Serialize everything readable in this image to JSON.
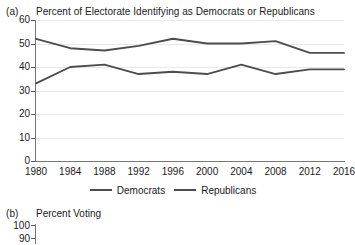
{
  "figure": {
    "panel_a_label": "(a)",
    "panel_b_label": "(b)"
  },
  "chart_data": [
    {
      "type": "line",
      "panel": "(a)",
      "title": "Percent of Electorate Identifying as Democrats or Republicans",
      "xlabel": "",
      "ylabel": "",
      "x": [
        1980,
        1984,
        1988,
        1992,
        1996,
        2000,
        2004,
        2008,
        2012,
        2016
      ],
      "categories": [
        "1980",
        "1984",
        "1988",
        "1992",
        "1996",
        "2000",
        "2004",
        "2008",
        "2012",
        "2016"
      ],
      "ylim": [
        0,
        60
      ],
      "yticks": [
        0,
        10,
        20,
        30,
        40,
        50,
        60
      ],
      "ytick_labels": [
        "0",
        "10",
        "20",
        "30",
        "40",
        "50",
        "60"
      ],
      "grid": true,
      "legend_position": "bottom",
      "series": [
        {
          "name": "Democrats",
          "color": "#4d4d4d",
          "values": [
            33,
            40,
            41,
            37,
            38,
            37,
            41,
            37,
            39,
            39
          ]
        },
        {
          "name": "Republicans",
          "color": "#4d4d4d",
          "values": [
            52,
            48,
            47,
            49,
            52,
            50,
            50,
            51,
            46,
            46
          ]
        }
      ]
    },
    {
      "type": "line",
      "panel": "(b)",
      "title": "Percent Voting",
      "ylim": [
        0,
        100
      ],
      "yticks": [
        100,
        90
      ],
      "ytick_labels": [
        "100",
        "90"
      ],
      "grid": true,
      "series": [],
      "note": "cropped"
    }
  ]
}
